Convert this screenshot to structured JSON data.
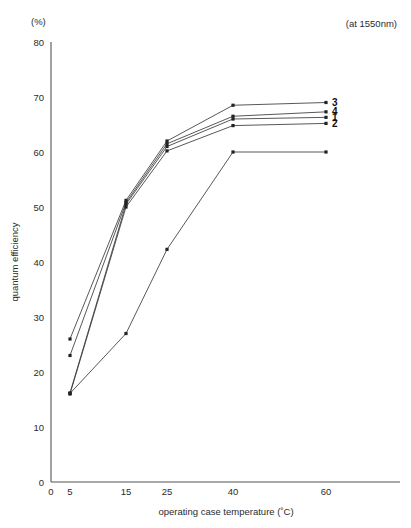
{
  "figure": {
    "unit_label": "(%)",
    "note": "(at 1550nm)",
    "x_axis_title": "operating case temperature (˚C)",
    "y_axis_title": "quantum efficiency"
  },
  "chart_data": {
    "type": "line",
    "title": "",
    "subtitle": "(at 1550nm)",
    "xlabel": "operating case temperature (˚C)",
    "ylabel": "quantum efficiency",
    "y_unit": "(%)",
    "annotation": "(at 1550nm)",
    "grid": false,
    "legend": "inline-right-end-labels",
    "x_scale": "categorical-uneven",
    "x_tick_labels": [
      "0",
      "5",
      "15",
      "25",
      "40",
      "60"
    ],
    "x_tick_values": [
      0,
      5,
      15,
      25,
      40,
      60
    ],
    "y_tick_labels": [
      "0",
      "10",
      "20",
      "30",
      "40",
      "50",
      "60",
      "70",
      "80"
    ],
    "y_tick_values": [
      0,
      10,
      20,
      30,
      40,
      50,
      60,
      70,
      80
    ],
    "xlim": [
      0,
      70
    ],
    "ylim": [
      0,
      80
    ],
    "x": [
      5,
      15,
      25,
      40,
      60
    ],
    "series": [
      {
        "name": "1",
        "label": "1",
        "values": [
          16.2,
          50.5,
          61.0,
          66.0,
          66.3
        ],
        "label_position": "right-end"
      },
      {
        "name": "2",
        "label": "2",
        "values": [
          16.0,
          50.0,
          60.2,
          64.8,
          65.2
        ],
        "label_position": "right-end"
      },
      {
        "name": "3",
        "label": "3",
        "values": [
          26.0,
          51.2,
          62.0,
          68.5,
          69.0
        ],
        "label_position": "right-end"
      },
      {
        "name": "4",
        "label": "4",
        "values": [
          23.0,
          50.8,
          61.5,
          66.5,
          67.3
        ],
        "label_position": "right-end"
      },
      {
        "name": "5",
        "label": "",
        "values": [
          16.1,
          27.0,
          42.3,
          60.0,
          60.0
        ],
        "label_position": "none",
        "note": "lower outlier curve rising from 5˚C through 25˚C and merging near 40˚C"
      }
    ],
    "series_label_order_top_to_bottom": [
      "3",
      "4",
      "1",
      "2"
    ]
  }
}
